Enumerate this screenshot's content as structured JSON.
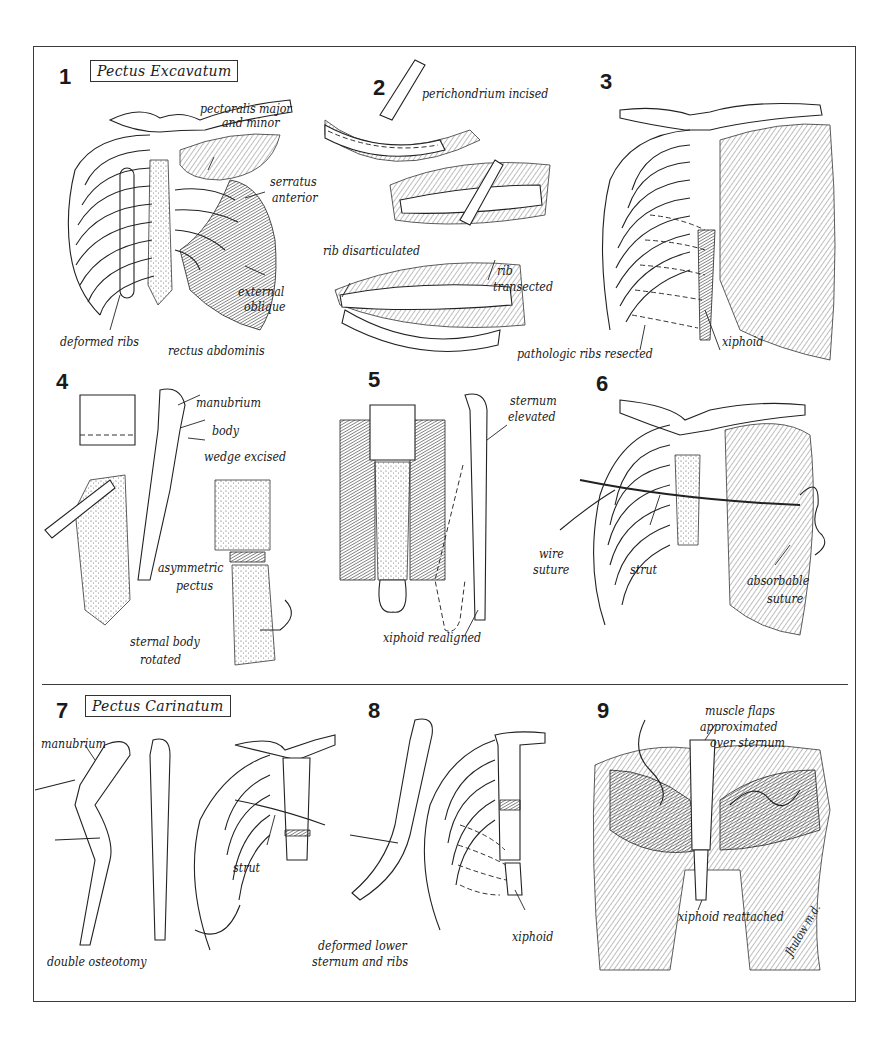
{
  "figure": {
    "sections": [
      {
        "id": "excavatum",
        "title": "Pectus Excavatum",
        "panels": [
          1,
          2,
          3,
          4,
          5,
          6
        ]
      },
      {
        "id": "carinatum",
        "title": "Pectus Carinatum",
        "panels": [
          7,
          8,
          9
        ]
      }
    ],
    "panels": [
      {
        "number": "1",
        "title": "Pectus Excavatum",
        "labels": [
          "pectoralis major",
          "and minor",
          "serratus",
          "anterior",
          "external",
          "oblique",
          "deformed ribs",
          "rectus abdominis"
        ]
      },
      {
        "number": "2",
        "labels": [
          "perichondrium incised",
          "rib disarticulated",
          "rib",
          "transected"
        ]
      },
      {
        "number": "3",
        "labels": [
          "pathologic ribs resected",
          "xiphoid"
        ]
      },
      {
        "number": "4",
        "labels": [
          "manubrium",
          "body",
          "wedge excised",
          "asymmetric",
          "pectus",
          "sternal body",
          "rotated"
        ]
      },
      {
        "number": "5",
        "labels": [
          "sternum",
          "elevated",
          "xiphoid realigned"
        ]
      },
      {
        "number": "6",
        "labels": [
          "wire",
          "suture",
          "strut",
          "absorbable",
          "suture"
        ]
      },
      {
        "number": "7",
        "title": "Pectus Carinatum",
        "labels": [
          "manubrium",
          "double osteotomy",
          "strut"
        ]
      },
      {
        "number": "8",
        "labels": [
          "deformed lower",
          "sternum and ribs",
          "xiphoid"
        ]
      },
      {
        "number": "9",
        "labels": [
          "muscle flaps",
          "approximated",
          "over sternum",
          "xiphoid reattached"
        ]
      }
    ],
    "signature": "Jhulow m.d."
  }
}
